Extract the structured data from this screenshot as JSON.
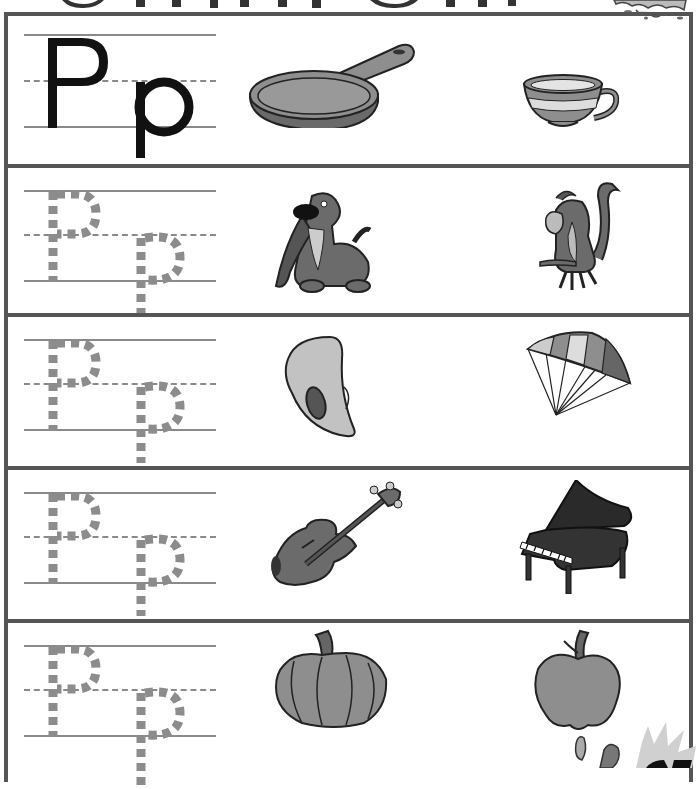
{
  "worksheet": {
    "letter_upper": "P",
    "letter_lower": "p",
    "title_visible": false,
    "colors": {
      "border": "#555555",
      "guide_line": "#8a8a8a",
      "trace_letter": "#8c8c8c",
      "solid_letter": "#111111",
      "fill_gray": "#8e8e8e",
      "fill_light": "#c9c9c9",
      "fill_dark": "#4a4a4a"
    },
    "rows": [
      {
        "id": 1,
        "type": "model",
        "letter_style": "solid",
        "left_picture": "frying-pan",
        "right_picture": "teacup"
      },
      {
        "id": 2,
        "type": "trace",
        "letter_style": "dotted",
        "left_picture": "dog",
        "right_picture": "monkey"
      },
      {
        "id": 3,
        "type": "trace",
        "letter_style": "dotted",
        "left_picture": "paint-palette",
        "right_picture": "parachute"
      },
      {
        "id": 4,
        "type": "trace",
        "letter_style": "dotted",
        "left_picture": "violin",
        "right_picture": "piano"
      },
      {
        "id": 5,
        "type": "trace",
        "letter_style": "dotted",
        "left_picture": "pumpkin",
        "right_picture": "apple"
      }
    ],
    "footer": {
      "page_number_visible": false
    }
  }
}
